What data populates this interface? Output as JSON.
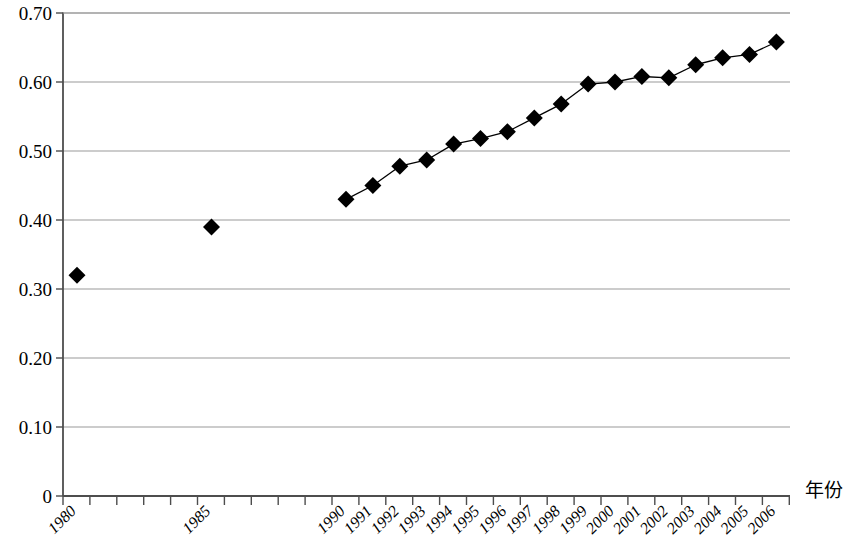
{
  "chart_data": {
    "type": "line",
    "title": "",
    "subtitle": "",
    "xlabel": "年份",
    "ylabel": "",
    "legend": [],
    "grid": true,
    "grid_axis": "y",
    "marker": "diamond",
    "marker_color": "#000000",
    "line_color": "#000000",
    "grid_color": "#999999",
    "axis_color": "#4d4d4d",
    "ylim": [
      0,
      0.7
    ],
    "ytick_labels": [
      "0.70",
      "0.60",
      "0.50",
      "0.40",
      "0.30",
      "0.20",
      "0.10",
      "0"
    ],
    "ytick_values": [
      0.7,
      0.6,
      0.5,
      0.4,
      0.3,
      0.2,
      0.1,
      0
    ],
    "categories": [
      "1980",
      "1981",
      "1982",
      "1983",
      "1984",
      "1985",
      "1986",
      "1987",
      "1988",
      "1989",
      "1990",
      "1991",
      "1992",
      "1993",
      "1994",
      "1995",
      "1996",
      "1997",
      "1998",
      "1999",
      "2000",
      "2001",
      "2002",
      "2003",
      "2004",
      "2005",
      "2006"
    ],
    "xtick_labels_shown": [
      "1980",
      "1985",
      "1990",
      "1991",
      "1992",
      "1993",
      "1994",
      "1995",
      "1996",
      "1997",
      "1998",
      "1999",
      "2000",
      "2001",
      "2002",
      "2003",
      "2004",
      "2005",
      "2006"
    ],
    "xtick_label_rotation": -45,
    "values": [
      0.32,
      null,
      null,
      null,
      null,
      0.39,
      null,
      null,
      null,
      null,
      0.43,
      0.45,
      0.478,
      0.487,
      0.51,
      0.518,
      0.528,
      0.548,
      0.568,
      0.597,
      0.6,
      0.608,
      0.606,
      0.625,
      0.635,
      0.64,
      0.658
    ],
    "points": [
      {
        "x": "1980",
        "y": 0.32,
        "connected": false
      },
      {
        "x": "1985",
        "y": 0.39,
        "connected": false
      },
      {
        "x": "1990",
        "y": 0.43,
        "connected": true
      },
      {
        "x": "1991",
        "y": 0.45,
        "connected": true
      },
      {
        "x": "1992",
        "y": 0.478,
        "connected": true
      },
      {
        "x": "1993",
        "y": 0.487,
        "connected": true
      },
      {
        "x": "1994",
        "y": 0.51,
        "connected": true
      },
      {
        "x": "1995",
        "y": 0.518,
        "connected": true
      },
      {
        "x": "1996",
        "y": 0.528,
        "connected": true
      },
      {
        "x": "1997",
        "y": 0.548,
        "connected": true
      },
      {
        "x": "1998",
        "y": 0.568,
        "connected": true
      },
      {
        "x": "1999",
        "y": 0.597,
        "connected": true
      },
      {
        "x": "2000",
        "y": 0.6,
        "connected": true
      },
      {
        "x": "2001",
        "y": 0.608,
        "connected": true
      },
      {
        "x": "2002",
        "y": 0.606,
        "connected": true
      },
      {
        "x": "2003",
        "y": 0.625,
        "connected": true
      },
      {
        "x": "2004",
        "y": 0.635,
        "connected": true
      },
      {
        "x": "2005",
        "y": 0.64,
        "connected": true
      },
      {
        "x": "2006",
        "y": 0.658,
        "connected": true
      }
    ]
  },
  "layout": {
    "plot_left": 63,
    "plot_right": 790,
    "plot_top": 13,
    "plot_bottom": 496,
    "tick_step": 26.9,
    "first_marker_x": 77,
    "xaxis_title_x": 805,
    "xaxis_title_y": 497
  }
}
